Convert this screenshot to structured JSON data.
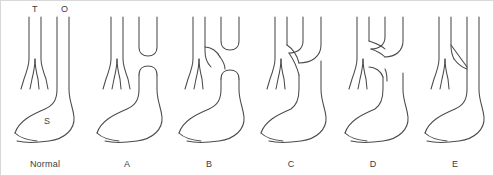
{
  "figure": {
    "background_color": "#ffffff",
    "line_color": "#4a4a4a",
    "border_color": "#d8d8d8",
    "text_color": "#3c3c3c",
    "width": 494,
    "height": 176
  },
  "top_labels": [
    {
      "text": "T",
      "meaning": "trachea",
      "x": 33,
      "y": 5
    },
    {
      "text": "O",
      "meaning": "oesophagus",
      "x": 62,
      "y": 5
    }
  ],
  "organ_labels": [
    {
      "text": "S",
      "meaning": "stomach",
      "x": 45,
      "y": 120
    }
  ],
  "panels": [
    {
      "id": "normal",
      "caption": "Normal",
      "origin_x": 0,
      "description": "Normal anatomy: trachea bifurcates into bronchi; oesophagus continuous from pharynx to stomach."
    },
    {
      "id": "a",
      "caption": "A",
      "origin_x": 82,
      "description": "Oesophageal atresia without fistula: blind upper pouch and separate blind lower segment."
    },
    {
      "id": "b",
      "caption": "B",
      "origin_x": 164,
      "description": "Oesophageal atresia with proximal tracheo-oesophageal fistula."
    },
    {
      "id": "c",
      "caption": "C",
      "origin_x": 246,
      "description": "Oesophageal atresia with distal tracheo-oesophageal fistula."
    },
    {
      "id": "d",
      "caption": "D",
      "origin_x": 328,
      "description": "Oesophageal atresia with both proximal and distal tracheo-oesophageal fistulae."
    },
    {
      "id": "e",
      "caption": "E",
      "origin_x": 410,
      "description": "H-type tracheo-oesophageal fistula with intact oesophagus."
    }
  ]
}
